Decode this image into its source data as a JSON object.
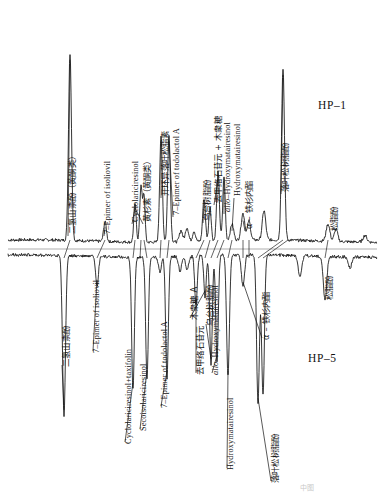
{
  "figure": {
    "type": "dual-gas-chromatogram",
    "panels": [
      {
        "id": "hp1",
        "tag": "HP–1",
        "orientation": "upward",
        "baseline_y": 241
      },
      {
        "id": "hp5",
        "tag": "HP–5",
        "orientation": "downward",
        "baseline_y": 256
      }
    ],
    "footnote": "中图"
  },
  "chart_data": {
    "type": "line",
    "title": "",
    "subtitle": "",
    "xlabel": "",
    "ylabel": "",
    "grid": false,
    "legend_position": "inside-right",
    "axis_ranges": {
      "x": [
        0,
        384
      ],
      "y": [
        0,
        1
      ]
    },
    "series": [
      {
        "name": "HP–1",
        "tag": "HP–1",
        "direction": "up",
        "baseline_y": 241,
        "peaks": [
          {
            "x": 70,
            "height": 0.985,
            "width": 2.1,
            "label_cn": "二氢山柰酚（黄酮类）",
            "label_en": ""
          },
          {
            "x": 105,
            "height": 0.105,
            "width": 2.0,
            "label_cn": "",
            "label_en": "7–Epimer of isoliovil"
          },
          {
            "x": 135,
            "height": 0.205,
            "width": 1.7,
            "label_cn": "黄杉素（黄酮类）",
            "label_en": "Cyclolariciresinol"
          },
          {
            "x": 141,
            "height": 0.3,
            "width": 1.7,
            "label_cn": "",
            "label_en": ""
          },
          {
            "x": 144,
            "height": 0.245,
            "width": 1.5,
            "label_cn": "",
            "label_en": ""
          },
          {
            "x": 161,
            "height": 0.56,
            "width": 1.9,
            "label_cn": "开环异落叶松脂素",
            "label_en": ""
          },
          {
            "x": 169,
            "height": 0.56,
            "width": 1.9,
            "label_cn": "",
            "label_en": "7–Epimer of todolactol A"
          },
          {
            "x": 181,
            "height": 0.06,
            "width": 2.2,
            "label_cn": "",
            "label_en": ""
          },
          {
            "x": 187,
            "height": 0.075,
            "width": 2.2,
            "label_cn": "",
            "label_en": ""
          },
          {
            "x": 194,
            "height": 0.055,
            "width": 2.0,
            "label_cn": "",
            "label_en": ""
          },
          {
            "x": 204,
            "height": 0.225,
            "width": 1.9,
            "label_cn": "乌台树脂酚",
            "label_en": ""
          },
          {
            "x": 210,
            "height": 0.18,
            "width": 1.7,
            "label_cn": "",
            "label_en": ""
          },
          {
            "x": 218,
            "height": 0.36,
            "width": 1.9,
            "label_cn": "去甲络石苷元 + 木衆糖",
            "label_en": ""
          },
          {
            "x": 224,
            "height": 0.34,
            "width": 1.7,
            "label_cn": "",
            "label_en": "allo–Hydroxymatairesinol"
          },
          {
            "x": 232,
            "height": 0.085,
            "width": 2.4,
            "label_cn": "",
            "label_en": "Hydroxymatairesinol"
          },
          {
            "x": 243,
            "height": 0.14,
            "width": 2.6,
            "label_cn": "α – 铁杉内酯",
            "label_en": ""
          },
          {
            "x": 249,
            "height": 0.1,
            "width": 2.2,
            "label_cn": "",
            "label_en": ""
          },
          {
            "x": 264,
            "height": 0.155,
            "width": 2.4,
            "label_cn": "",
            "label_en": ""
          },
          {
            "x": 283,
            "height": 0.905,
            "width": 2.1,
            "label_cn": "落叶松树脂酚",
            "label_en": ""
          },
          {
            "x": 328,
            "height": 0.09,
            "width": 2.6,
            "label_cn": "松脂酚",
            "label_en": ""
          },
          {
            "x": 336,
            "height": 0.065,
            "width": 2.4,
            "label_cn": "",
            "label_en": ""
          },
          {
            "x": 365,
            "height": 0.035,
            "width": 2.6,
            "label_cn": "",
            "label_en": ""
          }
        ]
      },
      {
        "name": "HP–5",
        "tag": "HP–5",
        "direction": "down",
        "baseline_y": 256,
        "peaks": [
          {
            "x": 64,
            "height": 0.82,
            "width": 2.1,
            "label_cn": "二氢山柰酚",
            "label_en": ""
          },
          {
            "x": 97,
            "height": 0.155,
            "width": 2.0,
            "label_cn": "",
            "label_en": "7–Epimer of isoliovil"
          },
          {
            "x": 133,
            "height": 0.68,
            "width": 1.9,
            "label_cn": "",
            "label_en": "Cyclolariciresinol+taxifolin"
          },
          {
            "x": 147,
            "height": 0.62,
            "width": 1.9,
            "label_cn": "",
            "label_en": "Secoisolariciresinol"
          },
          {
            "x": 160,
            "height": 0.08,
            "width": 2.0,
            "label_cn": "",
            "label_en": ""
          },
          {
            "x": 167,
            "height": 0.62,
            "width": 1.9,
            "label_cn": "",
            "label_en": "7–Epimer of todolactol A"
          },
          {
            "x": 180,
            "height": 0.075,
            "width": 2.2,
            "label_cn": "",
            "label_en": ""
          },
          {
            "x": 187,
            "height": 0.07,
            "width": 2.2,
            "label_cn": "",
            "label_en": ""
          },
          {
            "x": 196,
            "height": 0.255,
            "width": 1.8,
            "label_cn": "去甲络石苷元",
            "label_en": ""
          },
          {
            "x": 205,
            "height": 0.21,
            "width": 1.7,
            "label_cn": "木衆糖 A",
            "label_en": ""
          },
          {
            "x": 211,
            "height": 0.56,
            "width": 1.8,
            "label_cn": "乌台树脂酚",
            "label_en": ""
          },
          {
            "x": 217,
            "height": 0.54,
            "width": 1.8,
            "label_cn": "",
            "label_en": "allo–Hydroxymatairesinol"
          },
          {
            "x": 228,
            "height": 0.62,
            "width": 2.0,
            "label_cn": "",
            "label_en": "Hydroxymatairesinol"
          },
          {
            "x": 243,
            "height": 0.165,
            "width": 2.2,
            "label_cn": "α – 铁杉内酯",
            "label_en": ""
          },
          {
            "x": 258,
            "height": 0.76,
            "width": 2.0,
            "label_cn": "落叶松树脂酚",
            "label_en": ""
          },
          {
            "x": 263,
            "height": 0.72,
            "width": 2.0,
            "label_cn": "",
            "label_en": ""
          },
          {
            "x": 300,
            "height": 0.11,
            "width": 2.4,
            "label_cn": "",
            "label_en": ""
          },
          {
            "x": 325,
            "height": 0.225,
            "width": 2.4,
            "label_cn": "松脂酚",
            "label_en": ""
          },
          {
            "x": 350,
            "height": 0.055,
            "width": 2.4,
            "label_cn": "",
            "label_en": ""
          }
        ]
      }
    ]
  },
  "labels": {
    "hp1": [
      {
        "name": "dihydrokaempferol-flavonoid",
        "text": "二氢山柰酚（黄酮类）",
        "script": "cn",
        "x": 68,
        "y": 234
      },
      {
        "name": "7-epimer-of-isoliovil",
        "text": "7–Epimer of isoliovil",
        "script": "en",
        "x": 104,
        "y": 234
      },
      {
        "name": "cyclolariciresinol",
        "text": "Cyclolariciresinol",
        "script": "en",
        "x": 132,
        "y": 222
      },
      {
        "name": "taxifolin-flavonoid",
        "text": "黄杉素（黄酮类）",
        "script": "cn",
        "x": 143,
        "y": 222
      },
      {
        "name": "secoisolariciresinol-cn",
        "text": "开环异落叶松脂素",
        "script": "cn",
        "x": 161,
        "y": 196
      },
      {
        "name": "7-epimer-of-todolactol-a",
        "text": "7–Epimer of todolactol A",
        "script": "en",
        "x": 173,
        "y": 215
      },
      {
        "name": "matairesinol-cn",
        "text": "乌台树脂酚",
        "script": "cn",
        "x": 203,
        "y": 221
      },
      {
        "name": "nortrachelogenin-plus-xylose",
        "text": "去甲络石苷元 + 木衆糖",
        "script": "cn",
        "x": 214,
        "y": 203
      },
      {
        "name": "allo-hydroxymatairesinol",
        "text": "allo–Hydroxymatairesinol",
        "script": "en",
        "x": 224,
        "y": 212,
        "italic_prefix": "allo"
      },
      {
        "name": "hydroxymatairesinol",
        "text": "Hydroxymatairesinol",
        "script": "en",
        "x": 234,
        "y": 196
      },
      {
        "name": "alpha-conidendrin-lactone",
        "text": "α – 铁杉内酯",
        "script": "cn",
        "x": 245,
        "y": 229
      },
      {
        "name": "lariciresinol-cn",
        "text": "落叶松树脂酚",
        "script": "cn",
        "x": 281,
        "y": 192
      },
      {
        "name": "pinoresinol-cn",
        "text": "松脂酚",
        "script": "cn",
        "x": 330,
        "y": 231
      }
    ],
    "hp5": [
      {
        "name": "dihydrokaempferol",
        "text": "二氢山柰酚",
        "script": "cn",
        "x": 62,
        "y": 367
      },
      {
        "name": "7-epimer-of-isoliovil-hp5",
        "text": "7–Epimer of isoliovil",
        "script": "en",
        "x": 93,
        "y": 353
      },
      {
        "name": "cyclolariciresinol-taxifolin",
        "text": "Cyclolariciresinol+taxifolin",
        "script": "en",
        "x": 125,
        "y": 444
      },
      {
        "name": "secoisolariciresinol",
        "text": "Secoisolariciresinol",
        "script": "en",
        "x": 140,
        "y": 431
      },
      {
        "name": "7-epimer-of-todolactol-a-hp5",
        "text": "7–Epimer of todolactol A",
        "script": "en",
        "x": 161,
        "y": 408
      },
      {
        "name": "nortrachelogenin",
        "text": "去甲络石苷元",
        "script": "cn",
        "x": 196,
        "y": 375
      },
      {
        "name": "xylose-a",
        "text": "木衆糖 A",
        "script": "cn",
        "x": 190,
        "y": 320
      },
      {
        "name": "matairesinol-cn-hp5",
        "text": "乌台树脂酚",
        "script": "cn",
        "x": 206,
        "y": 326
      },
      {
        "name": "allo-hydroxymatairesinol-hp5",
        "text": "allo–Hydroxymatairesinol",
        "script": "en",
        "x": 212,
        "y": 375,
        "italic_prefix": "allo"
      },
      {
        "name": "hydroxymatairesinol-hp5",
        "text": "Hydroxymatairesinol",
        "script": "en",
        "x": 227,
        "y": 470
      },
      {
        "name": "alpha-conidendrin-lactone-hp5",
        "text": "α – 铁杉内酯",
        "script": "cn",
        "x": 262,
        "y": 340
      },
      {
        "name": "lariciresinol-cn-hp5",
        "text": "落叶松树脂酚",
        "script": "cn",
        "x": 271,
        "y": 483
      },
      {
        "name": "pinoresinol-cn-hp5",
        "text": "松脂酚",
        "script": "cn",
        "x": 325,
        "y": 300
      }
    ]
  },
  "tags": {
    "hp1": {
      "text": "HP–1",
      "x": 318,
      "y": 99
    },
    "hp5": {
      "text": "HP–5",
      "x": 308,
      "y": 352
    }
  }
}
